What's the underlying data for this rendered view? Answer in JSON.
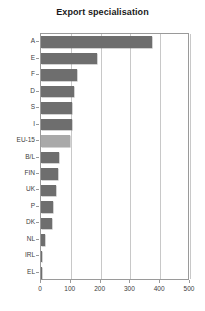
{
  "chart_data": {
    "type": "bar",
    "orientation": "horizontal",
    "title": "Export specialisation",
    "xlabel": "",
    "ylabel": "",
    "categories": [
      "A",
      "E",
      "F",
      "D",
      "S",
      "I",
      "EU-15",
      "B/L",
      "FIN",
      "UK",
      "P",
      "DK",
      "NL",
      "IRL",
      "EL"
    ],
    "values": [
      373,
      188,
      121,
      112,
      105,
      103,
      98,
      62,
      58,
      52,
      41,
      37,
      14,
      5,
      3
    ],
    "highlight_category": "EU-15",
    "xlim": [
      0,
      500
    ],
    "xticks": [
      0,
      100,
      200,
      300,
      400,
      500
    ],
    "xtick_labels": [
      "0",
      "100",
      "200",
      "300",
      "400",
      "500"
    ],
    "grid": true,
    "grid_axis": "x",
    "legend": false,
    "bar_color": "#6e6e6e",
    "highlight_color": "#a9a9a9"
  }
}
